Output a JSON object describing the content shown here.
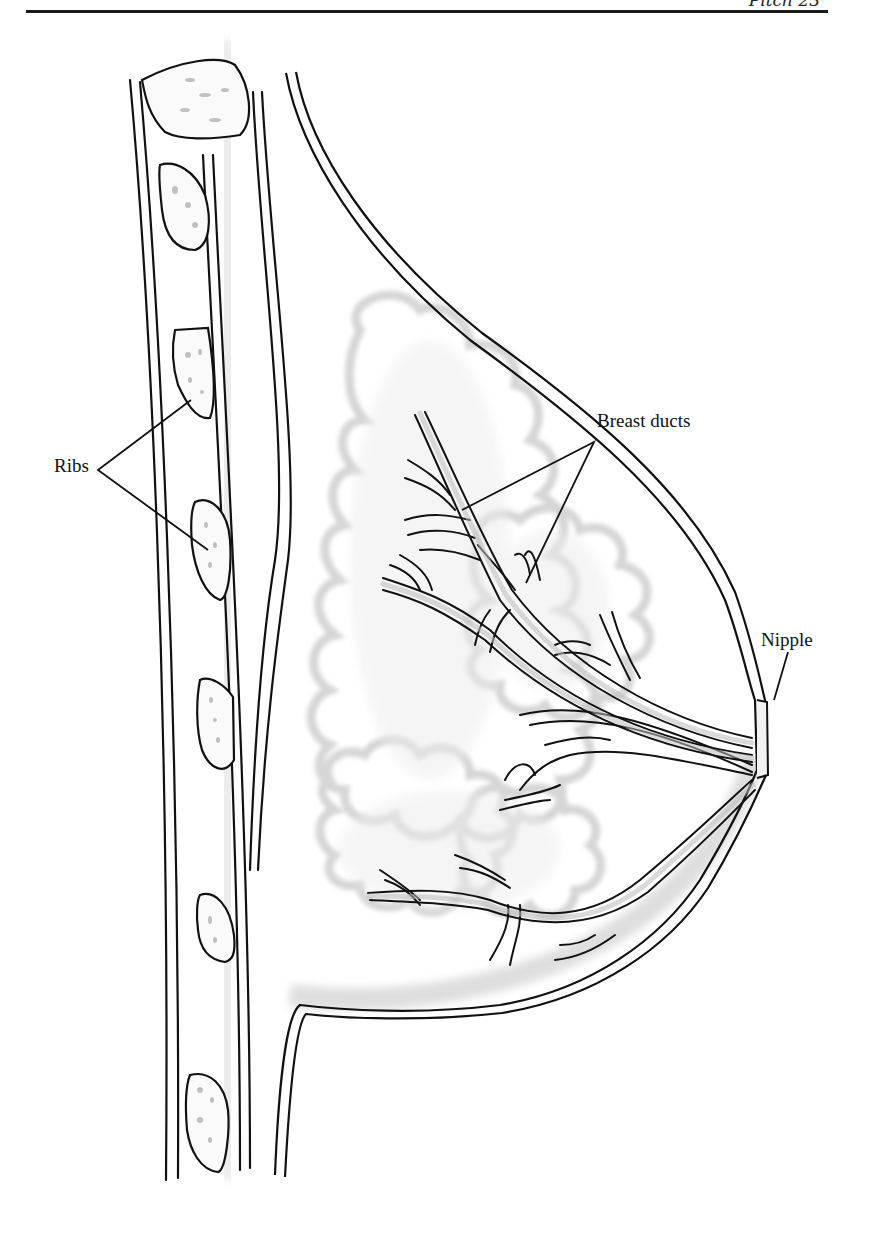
{
  "page": {
    "header_text": "Pitch 23",
    "background": "#ffffff",
    "rule_color": "#1a1a1a"
  },
  "figure": {
    "line_color": "#111111",
    "shading_color": "#d9d9d9",
    "labels": {
      "ribs": "Ribs",
      "breast_ducts": "Breast ducts",
      "nipple": "Nipple"
    }
  }
}
